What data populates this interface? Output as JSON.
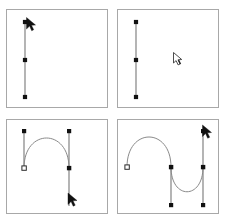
{
  "figure": {
    "caption_left": "",
    "caption_right": "",
    "stroke_color": "#777777",
    "anchor_fill": "#111111",
    "anchor_hollow_fill": "#ffffff",
    "panel_border_color": "#a8a8a8",
    "background": "#ffffff"
  },
  "panels": [
    {
      "id": "panel-1",
      "label": "Step 1 — straight segment with direction handle",
      "type": "straight-path",
      "anchors": [
        {
          "name": "anchor-top",
          "x": 18,
          "y": 12,
          "style": "filled"
        },
        {
          "name": "anchor-middle",
          "x": 18,
          "y": 50,
          "style": "filled"
        },
        {
          "name": "anchor-bottom",
          "x": 18,
          "y": 87,
          "style": "filled"
        }
      ],
      "segments": [
        {
          "from": [
            18,
            12
          ],
          "to": [
            18,
            87
          ]
        }
      ],
      "cursor": {
        "name": "pen-arrow-cursor",
        "x": 20,
        "y": 8,
        "kind": "arrow"
      }
    },
    {
      "id": "panel-2",
      "label": "Step 2 — segment drawn, pointer moved away",
      "type": "straight-path",
      "anchors": [
        {
          "name": "anchor-top",
          "x": 18,
          "y": 12,
          "style": "filled"
        },
        {
          "name": "anchor-middle",
          "x": 18,
          "y": 50,
          "style": "filled"
        },
        {
          "name": "anchor-bottom",
          "x": 18,
          "y": 87,
          "style": "filled"
        }
      ],
      "segments": [
        {
          "from": [
            18,
            12
          ],
          "to": [
            18,
            87
          ]
        }
      ],
      "cursor": {
        "name": "hand-pointer-cursor",
        "x": 57,
        "y": 44,
        "kind": "pointer"
      }
    },
    {
      "id": "panel-3",
      "label": "Step 3 — single arch curve with two direction handles",
      "type": "arch-curve",
      "anchors": [
        {
          "name": "anchor-left",
          "x": 17,
          "y": 48,
          "style": "hollow"
        },
        {
          "name": "anchor-right",
          "x": 62,
          "y": 48,
          "style": "filled"
        },
        {
          "name": "handle-end-left-top",
          "x": 17,
          "y": 11,
          "style": "filled"
        },
        {
          "name": "handle-end-right-top",
          "x": 62,
          "y": 11,
          "style": "filled"
        }
      ],
      "handles": [
        {
          "from": [
            17,
            48
          ],
          "to": [
            17,
            11
          ]
        },
        {
          "from": [
            62,
            48
          ],
          "to": [
            62,
            11
          ]
        }
      ],
      "curve": {
        "start": [
          17,
          48
        ],
        "c1": [
          17,
          8
        ],
        "c2": [
          62,
          8
        ],
        "end": [
          62,
          48
        ]
      },
      "extra_line": {
        "from": [
          62,
          48
        ],
        "to": [
          62,
          86
        ]
      },
      "cursor": {
        "name": "pen-arrow-cursor",
        "x": 62,
        "y": 78,
        "kind": "arrow"
      }
    },
    {
      "id": "panel-4",
      "label": "Step 4 — S-curve with three anchor points",
      "type": "s-curve",
      "anchors": [
        {
          "name": "anchor-start",
          "x": 9,
          "y": 47,
          "style": "hollow"
        },
        {
          "name": "anchor-middle",
          "x": 53,
          "y": 47,
          "style": "filled"
        },
        {
          "name": "anchor-end",
          "x": 85,
          "y": 47,
          "style": "filled"
        },
        {
          "name": "handle-end-middle-bottom",
          "x": 53,
          "y": 85,
          "style": "filled"
        },
        {
          "name": "handle-end-right-bottom",
          "x": 85,
          "y": 85,
          "style": "filled"
        },
        {
          "name": "handle-end-right-top",
          "x": 85,
          "y": 11,
          "style": "filled"
        }
      ],
      "handles": [
        {
          "from": [
            53,
            47
          ],
          "to": [
            53,
            85
          ]
        },
        {
          "from": [
            85,
            47
          ],
          "to": [
            85,
            85
          ]
        },
        {
          "from": [
            85,
            47
          ],
          "to": [
            85,
            11
          ]
        }
      ],
      "curves": [
        {
          "start": [
            9,
            47
          ],
          "c1": [
            9,
            7
          ],
          "c2": [
            53,
            7
          ],
          "end": [
            53,
            47
          ]
        },
        {
          "start": [
            53,
            47
          ],
          "c1": [
            53,
            80
          ],
          "c2": [
            85,
            80
          ],
          "end": [
            85,
            47
          ]
        }
      ],
      "cursor": {
        "name": "pen-arrow-cursor",
        "x": 86,
        "y": 8,
        "kind": "arrow"
      }
    }
  ]
}
